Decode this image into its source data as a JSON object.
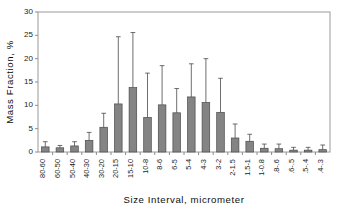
{
  "chart_data": {
    "type": "bar",
    "title": "",
    "xlabel": "Size Interval, micrometer",
    "ylabel": "Mass Fraction, %",
    "ylim": [
      0,
      30
    ],
    "yticks": [
      0,
      5,
      10,
      15,
      20,
      25,
      30
    ],
    "ytick_labels": [
      "0",
      "5",
      "10",
      "15",
      "20",
      "25",
      "30"
    ],
    "grid": false,
    "legend": null,
    "error_bars": "upper-only",
    "bar_color": "#848484",
    "bar_edge_color": "#4a4a4a",
    "categories": [
      "80-60",
      "60-50",
      "50-40",
      "40-30",
      "30-20",
      "20-15",
      "15-10",
      "10-8",
      "8-6",
      "6-5",
      "5-4",
      "4-3",
      "3-2",
      "2-1.5",
      "1.5-1",
      "1-0.8",
      ".8-.6",
      ".6-.5",
      ".5-.4",
      ".4-.3"
    ],
    "values": [
      1.1,
      0.9,
      1.3,
      2.5,
      5.3,
      10.3,
      13.8,
      7.4,
      10.1,
      8.4,
      11.8,
      10.6,
      8.5,
      3.0,
      2.3,
      0.8,
      0.7,
      0.4,
      0.4,
      0.5
    ],
    "error_upper": [
      1.1,
      0.5,
      0.9,
      1.7,
      3.0,
      14.4,
      11.8,
      9.5,
      8.4,
      5.2,
      7.1,
      9.4,
      7.3,
      3.0,
      1.5,
      0.9,
      1.0,
      0.6,
      0.6,
      1.0
    ]
  }
}
